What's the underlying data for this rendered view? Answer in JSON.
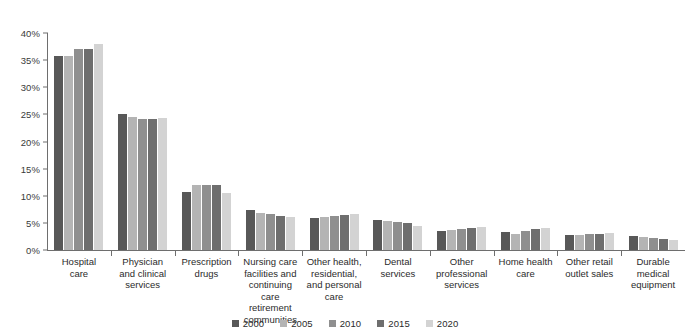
{
  "chart_data": {
    "type": "bar",
    "title": "",
    "subtitle": "",
    "xlabel": "",
    "ylabel": "",
    "ylim": [
      0,
      40
    ],
    "ytick_labels": [
      "0%",
      "5%",
      "10%",
      "15%",
      "20%",
      "25%",
      "30%",
      "35%",
      "40%"
    ],
    "ytick_values": [
      0,
      5,
      10,
      15,
      20,
      25,
      30,
      35,
      40
    ],
    "grid": false,
    "legend_position": "bottom",
    "categories": [
      "Hospital care",
      "Physician and clinical services",
      "Prescription drugs",
      "Nursing care facilities and continuing care retirement communities",
      "Other health, residential, and personal care",
      "Dental services",
      "Other professional services",
      "Home health care",
      "Other retail outlet sales",
      "Durable medical equipment"
    ],
    "category_lines": [
      [
        "Hospital",
        "care"
      ],
      [
        "Physician",
        "and clinical",
        "services"
      ],
      [
        "Prescription",
        "drugs"
      ],
      [
        "Nursing care",
        "facilities and",
        "continuing",
        "care retirement",
        "communities"
      ],
      [
        "Other health,",
        "residential,",
        "and personal",
        "care"
      ],
      [
        "Dental",
        "services"
      ],
      [
        "Other",
        "professional",
        "services"
      ],
      [
        "Home health",
        "care"
      ],
      [
        "Other retail",
        "outlet sales"
      ],
      [
        "Durable",
        "medical",
        "equipment"
      ]
    ],
    "series": [
      {
        "name": "2000",
        "color": "#585858",
        "values": [
          35.8,
          25.0,
          10.7,
          7.3,
          5.9,
          5.5,
          3.5,
          3.3,
          2.8,
          2.6
        ]
      },
      {
        "name": "2005",
        "color": "#b4b4b4",
        "values": [
          35.8,
          24.5,
          12.0,
          6.8,
          6.0,
          5.4,
          3.6,
          3.0,
          2.7,
          2.4
        ]
      },
      {
        "name": "2010",
        "color": "#8f8f8f",
        "values": [
          37.0,
          24.2,
          11.9,
          6.6,
          6.2,
          5.2,
          3.9,
          3.5,
          2.9,
          2.3
        ]
      },
      {
        "name": "2015",
        "color": "#6e6e6e",
        "values": [
          37.0,
          24.2,
          12.0,
          6.3,
          6.4,
          4.9,
          4.0,
          3.9,
          3.0,
          2.1
        ]
      },
      {
        "name": "2020",
        "color": "#d3d3d3",
        "values": [
          38.0,
          24.4,
          10.5,
          6.1,
          6.6,
          4.5,
          4.2,
          4.1,
          3.1,
          1.9
        ]
      }
    ]
  },
  "legend": {
    "items": [
      {
        "label": "2000"
      },
      {
        "label": "2005"
      },
      {
        "label": "2010"
      },
      {
        "label": "2015"
      },
      {
        "label": "2020"
      }
    ]
  }
}
